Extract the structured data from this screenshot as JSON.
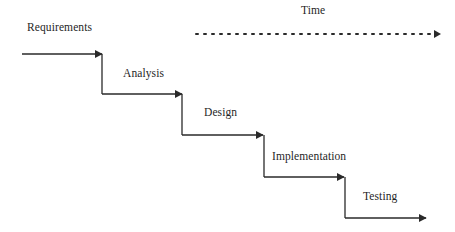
{
  "diagram": {
    "type": "waterfall",
    "time_axis": {
      "label": "Time",
      "style": "dotted",
      "direction": "right"
    },
    "phases": [
      {
        "label": "Requirements"
      },
      {
        "label": "Analysis"
      },
      {
        "label": "Design"
      },
      {
        "label": "Implementation"
      },
      {
        "label": "Testing"
      }
    ],
    "colors": {
      "line": "#2a2a2a",
      "text": "#1f1f1f",
      "background": "#ffffff"
    }
  }
}
